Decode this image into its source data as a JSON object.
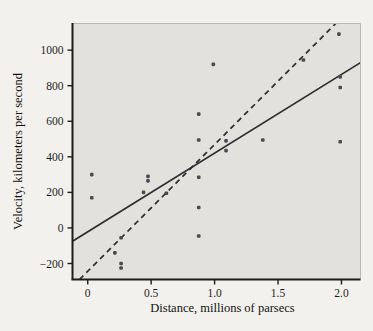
{
  "chart_data": {
    "type": "scatter",
    "title": "",
    "subtitle": "",
    "xlabel": "Distance, millions of parsecs",
    "ylabel": "Velocity, kilometers per second",
    "xlim": [
      -0.12,
      2.15
    ],
    "ylim": [
      -290,
      1150
    ],
    "xticks": [
      0,
      0.5,
      1.0,
      1.5,
      2.0
    ],
    "xticklabels": [
      "0",
      "0.5",
      "1.0",
      "1.5",
      "2.0"
    ],
    "yticks": [
      -200,
      0,
      200,
      400,
      600,
      800,
      1000
    ],
    "yticklabels": [
      "−200",
      "0",
      "200",
      "400",
      "600",
      "800",
      "1000"
    ],
    "grid": false,
    "legend": "none",
    "plot_background": "#e3e1dd",
    "point_color": "#4a4a52",
    "line_color": "#2b2b30",
    "points": [
      {
        "x": 0.032,
        "y": 300
      },
      {
        "x": 0.032,
        "y": 170
      },
      {
        "x": 0.214,
        "y": -140
      },
      {
        "x": 0.263,
        "y": -55
      },
      {
        "x": 0.263,
        "y": -200
      },
      {
        "x": 0.263,
        "y": -225
      },
      {
        "x": 0.44,
        "y": 200
      },
      {
        "x": 0.475,
        "y": 290
      },
      {
        "x": 0.475,
        "y": 265
      },
      {
        "x": 0.62,
        "y": 195
      },
      {
        "x": 0.875,
        "y": 640
      },
      {
        "x": 0.875,
        "y": 495
      },
      {
        "x": 0.875,
        "y": 285
      },
      {
        "x": 0.875,
        "y": 115
      },
      {
        "x": 0.875,
        "y": -45
      },
      {
        "x": 0.99,
        "y": 920
      },
      {
        "x": 1.09,
        "y": 490
      },
      {
        "x": 1.09,
        "y": 435
      },
      {
        "x": 1.38,
        "y": 495
      },
      {
        "x": 1.7,
        "y": 945
      },
      {
        "x": 1.98,
        "y": 1090
      },
      {
        "x": 1.99,
        "y": 850
      },
      {
        "x": 1.99,
        "y": 790
      },
      {
        "x": 1.99,
        "y": 485
      }
    ],
    "lines": [
      {
        "name": "solid-fit-line",
        "style": "solid",
        "x0": -0.12,
        "y0": -75,
        "x1": 2.15,
        "y1": 930
      },
      {
        "name": "dashed-fit-line",
        "style": "dashed",
        "x0": -0.065,
        "y0": -290,
        "x1": 1.955,
        "y1": 1150
      }
    ]
  }
}
